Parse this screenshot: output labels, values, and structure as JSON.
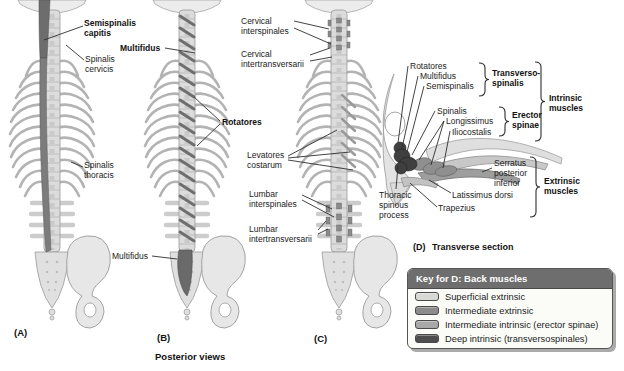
{
  "figure": {
    "caption": "Posterior views",
    "panel_a": "(A)",
    "panel_b": "(B)",
    "panel_c": "(C)",
    "panel_d_letter": "(D)",
    "panel_d_title": "Transverse section"
  },
  "labels": {
    "semispinalis_capitis": "Semispinalis capitis",
    "spinalis_cervicis": "Spinalis cervicis",
    "spinalis_thoracis": "Spinalis thoracis",
    "multifidus_lower": "Multifidus",
    "multifidus_upper": "Multifidus",
    "rotatores": "Rotatores",
    "cervical_interspinales": "Cervical interspinales",
    "cervical_intertransversarii": "Cervical intertransversarii",
    "levatores_costarum": "Levatores costarum",
    "lumbar_interspinales": "Lumbar interspinales",
    "lumbar_intertransversarii": "Lumbar intertransversarii"
  },
  "section_d": {
    "rotatores": "Rotatores",
    "multifidus": "Multifidus",
    "semispinalis": "Semispinalis",
    "transversospinalis": "Transverso-spinalis",
    "spinalis": "Spinalis",
    "longissimus": "Longissimus",
    "iliocostalis": "Iliocostalis",
    "erector_spinae": "Erector spinae",
    "intrinsic": "Intrinsic muscles",
    "serratus": "Serratus posterior inferior",
    "latissimus": "Latissimus dorsi",
    "trapezius": "Trapezius",
    "extrinsic": "Extrinsic muscles",
    "thoracic_spinous_process": "Thoracic spinous process"
  },
  "key": {
    "title": "Key for D: Back muscles",
    "items": [
      {
        "label": "Superficial extrinsic",
        "color": "#d8d8d5"
      },
      {
        "label": "Intermediate extrinsic",
        "color": "#8b8b8b"
      },
      {
        "label": "Intermediate intrinsic (erector spinae)",
        "color": "#a8a8a8"
      },
      {
        "label": "Deep intrinsic (transversospinales)",
        "color": "#4e4e4e"
      }
    ]
  }
}
